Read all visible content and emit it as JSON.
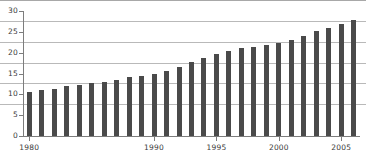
{
  "chart_data": {
    "type": "bar",
    "title": "",
    "subtitle": "",
    "xlabel": "",
    "ylabel": "",
    "ylim": [
      0,
      30
    ],
    "ytick_values": [
      0,
      5,
      10,
      15,
      20,
      25,
      30
    ],
    "ytick_labels": [
      "0",
      "5",
      "10",
      "15",
      "20",
      "25",
      "30"
    ],
    "grid": true,
    "grid_axis": "y",
    "legend": false,
    "legend_position": "none",
    "bar_color": "#4a4a4a",
    "gridline_color": "#b9b9b9",
    "axis_color": "#7d7d7d",
    "categories": [
      "1980",
      "1981",
      "1982",
      "1983",
      "1984",
      "1986",
      "1986",
      "1987",
      "1988",
      "1989",
      "1990",
      "1991",
      "1992",
      "1993",
      "1994",
      "1995",
      "1996",
      "1997",
      "1998",
      "1999",
      "2000",
      "2001",
      "2002",
      "2003",
      "2004",
      "2005",
      "2006"
    ],
    "values": [
      10.5,
      11.0,
      11.4,
      12.0,
      12.3,
      12.7,
      13.0,
      13.5,
      14.2,
      14.5,
      14.8,
      15.5,
      16.6,
      17.7,
      18.8,
      19.8,
      20.5,
      21.1,
      21.4,
      21.9,
      22.3,
      23.1,
      24.0,
      25.1,
      26.0,
      27.0,
      27.8
    ],
    "xtick_labels": [
      "1980",
      "1985",
      "1990",
      "1995",
      "2000",
      "2005"
    ],
    "xtick_categories": [
      "1980",
      "1985",
      "1990",
      "1995",
      "2000",
      "2005"
    ]
  }
}
